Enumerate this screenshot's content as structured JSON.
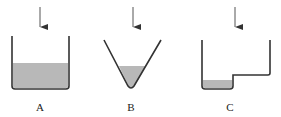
{
  "diagram": {
    "colors": {
      "stroke": "#333333",
      "liquid": "#b8b8b8",
      "background": "#ffffff"
    },
    "containers": [
      {
        "id": "A",
        "label": "A",
        "shape": "rectangular beaker"
      },
      {
        "id": "B",
        "label": "B",
        "shape": "V-shaped (conical) vessel"
      },
      {
        "id": "C",
        "label": "C",
        "shape": "stepped vessel with deep left well"
      }
    ]
  }
}
